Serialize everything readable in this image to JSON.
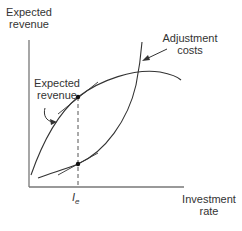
{
  "diagram": {
    "y_axis_label_line1": "Expected",
    "y_axis_label_line2": "revenue",
    "x_axis_label_line1": "Investment",
    "x_axis_label_line2": "rate",
    "curve_revenue_label_line1": "Expected",
    "curve_revenue_label_line2": "revenue",
    "curve_costs_label_line1": "Adjustment",
    "curve_costs_label_line2": "costs",
    "x_tick_label": "I",
    "x_tick_subscript": "e",
    "colors": {
      "line": "#333333",
      "axis": "#666666",
      "background": "#ffffff"
    }
  }
}
